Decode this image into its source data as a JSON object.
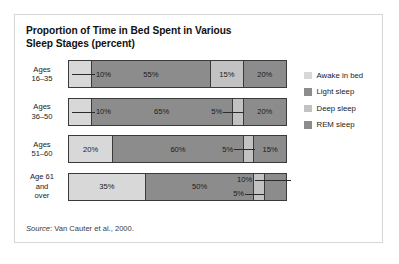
{
  "figure": {
    "title_line1": "Proportion of Time in Bed Spent in Various",
    "title_line2": "Sleep Stages (percent)",
    "source_word": "Source",
    "source_rest": ": Van Cauter et al., 2000."
  },
  "chart_data": {
    "type": "bar",
    "orientation": "horizontal",
    "stacked": true,
    "normalized_percent": true,
    "title": "Proportion of Time in Bed Spent in Various Sleep Stages (percent)",
    "xlabel": "",
    "ylabel": "",
    "xlim": [
      0,
      100
    ],
    "grid": false,
    "legend_position": "right",
    "categories": [
      "Ages 16–35",
      "Ages 36–50",
      "Ages 51–60",
      "Age 61 and over"
    ],
    "series": [
      {
        "name": "Awake in bed",
        "color": "#d8d8d8",
        "values": [
          10,
          10,
          20,
          35
        ]
      },
      {
        "name": "Light sleep",
        "color": "#8c8c8c",
        "values": [
          55,
          65,
          60,
          50
        ]
      },
      {
        "name": "Deep sleep",
        "color": "#c2c2c2",
        "values": [
          15,
          5,
          5,
          5
        ]
      },
      {
        "name": "REM sleep",
        "color": "#8c8c8c",
        "values": [
          20,
          20,
          15,
          10
        ]
      }
    ],
    "annotations": [
      {
        "row": "Ages 16–35",
        "text": "10%",
        "placement": "right-of-segment-with-leader"
      },
      {
        "row": "Ages 36–50",
        "text": "10%",
        "placement": "right-of-segment-with-leader"
      },
      {
        "row": "Ages 36–50",
        "text": "5%",
        "placement": "left-of-segment-with-leader"
      },
      {
        "row": "Ages 51–60",
        "text": "5%",
        "placement": "left-of-segment-with-leader"
      },
      {
        "row": "Age 61 and over",
        "text": "10%",
        "placement": "above-left-with-leader"
      },
      {
        "row": "Age 61 and over",
        "text": "5%",
        "placement": "below-left-with-leader"
      }
    ]
  },
  "rows": [
    {
      "label_line1": "Ages",
      "label_line2": "16–35",
      "label_line3": "",
      "segments": [
        {
          "stage": "Awake in bed",
          "value": 10,
          "label": "10%",
          "color": "#d8d8d8",
          "label_mode": "callout-right"
        },
        {
          "stage": "Light sleep",
          "value": 55,
          "label": "55%",
          "color": "#8c8c8c",
          "label_mode": "inside"
        },
        {
          "stage": "Deep sleep",
          "value": 15,
          "label": "15%",
          "color": "#c2c2c2",
          "label_mode": "inside"
        },
        {
          "stage": "REM sleep",
          "value": 20,
          "label": "20%",
          "color": "#8c8c8c",
          "label_mode": "inside"
        }
      ]
    },
    {
      "label_line1": "Ages",
      "label_line2": "36–50",
      "label_line3": "",
      "segments": [
        {
          "stage": "Awake in bed",
          "value": 10,
          "label": "10%",
          "color": "#d8d8d8",
          "label_mode": "callout-right"
        },
        {
          "stage": "Light sleep",
          "value": 65,
          "label": "65%",
          "color": "#8c8c8c",
          "label_mode": "inside"
        },
        {
          "stage": "Deep sleep",
          "value": 5,
          "label": "5%",
          "color": "#c2c2c2",
          "label_mode": "callout-left"
        },
        {
          "stage": "REM sleep",
          "value": 20,
          "label": "20%",
          "color": "#8c8c8c",
          "label_mode": "inside"
        }
      ]
    },
    {
      "label_line1": "Ages",
      "label_line2": "51–60",
      "label_line3": "",
      "segments": [
        {
          "stage": "Awake in bed",
          "value": 20,
          "label": "20%",
          "color": "#d8d8d8",
          "label_mode": "inside"
        },
        {
          "stage": "Light sleep",
          "value": 60,
          "label": "60%",
          "color": "#8c8c8c",
          "label_mode": "inside"
        },
        {
          "stage": "Deep sleep",
          "value": 5,
          "label": "5%",
          "color": "#c2c2c2",
          "label_mode": "callout-left"
        },
        {
          "stage": "REM sleep",
          "value": 15,
          "label": "15%",
          "color": "#8c8c8c",
          "label_mode": "inside"
        }
      ]
    },
    {
      "label_line1": "Age 61",
      "label_line2": "and",
      "label_line3": "over",
      "segments": [
        {
          "stage": "Awake in bed",
          "value": 35,
          "label": "35%",
          "color": "#d8d8d8",
          "label_mode": "inside"
        },
        {
          "stage": "Light sleep",
          "value": 50,
          "label": "50%",
          "color": "#8c8c8c",
          "label_mode": "inside"
        },
        {
          "stage": "Deep sleep",
          "value": 5,
          "label": "5%",
          "color": "#c2c2c2",
          "label_mode": "callout-below"
        },
        {
          "stage": "REM sleep",
          "value": 10,
          "label": "10%",
          "color": "#8c8c8c",
          "label_mode": "callout-above"
        }
      ]
    }
  ],
  "legend": {
    "items": [
      {
        "label": "Awake in bed",
        "color": "#d8d8d8"
      },
      {
        "label": "Light sleep",
        "color": "#8c8c8c"
      },
      {
        "label": "Deep sleep",
        "color": "#c2c2c2"
      },
      {
        "label": "REM sleep",
        "color": "#8c8c8c"
      }
    ]
  }
}
